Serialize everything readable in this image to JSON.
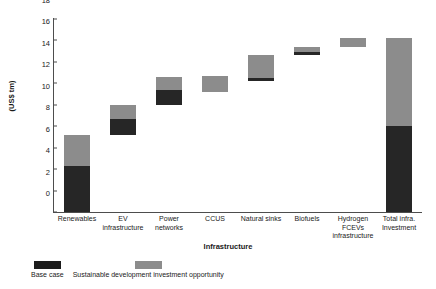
{
  "chart_data": {
    "type": "bar",
    "subtype": "waterfall-stacked",
    "title": "",
    "xlabel": "Infrastructure",
    "ylabel": "(US$ tm)",
    "ylim": [
      0,
      18
    ],
    "ytick_values": [
      0,
      2,
      4,
      6,
      8,
      10,
      12,
      14,
      16,
      18
    ],
    "ytick_labels": [
      "0",
      "2",
      "4",
      "6",
      "8",
      "10",
      "12",
      "14",
      "16",
      "18"
    ],
    "grid": false,
    "legend_position": "below-left",
    "categories": [
      "Renewables",
      "EV infrastructure",
      "Power networks",
      "CCUS",
      "Natural sinks",
      "Biofuels",
      "Hydrogen FCEVs infrastructure",
      "Total infra. Investment"
    ],
    "series": [
      {
        "name": "Base case",
        "color": "#262626",
        "values": [
          4.3,
          1.5,
          1.4,
          0.0,
          0.3,
          0.3,
          0.0,
          8.0
        ]
      },
      {
        "name": "Sustainable development investment opportunity",
        "color": "#8c8c8c",
        "values": [
          2.9,
          1.3,
          1.2,
          1.5,
          2.1,
          0.5,
          0.8,
          8.2
        ]
      }
    ],
    "bars": [
      {
        "category": "Renewables",
        "start": 0.0,
        "base_case": 4.3,
        "opportunity": 2.9,
        "total": 7.2,
        "is_total": false
      },
      {
        "category": "EV infrastructure",
        "start": 7.2,
        "base_case": 1.5,
        "opportunity": 1.3,
        "total": 10.0,
        "is_total": false
      },
      {
        "category": "Power networks",
        "start": 10.0,
        "base_case": 1.4,
        "opportunity": 1.2,
        "total": 12.6,
        "is_total": false
      },
      {
        "category": "CCUS",
        "start": 11.2,
        "base_case": 0.0,
        "opportunity": 1.5,
        "total": 12.7,
        "is_total": false
      },
      {
        "category": "Natural sinks",
        "start": 12.2,
        "base_case": 0.3,
        "opportunity": 2.1,
        "total": 14.6,
        "is_total": false
      },
      {
        "category": "Biofuels",
        "start": 14.6,
        "base_case": 0.3,
        "opportunity": 0.5,
        "total": 15.4,
        "is_total": false
      },
      {
        "category": "Hydrogen FCEVs infrastructure",
        "start": 15.4,
        "base_case": 0.0,
        "opportunity": 0.8,
        "total": 16.2,
        "is_total": false
      },
      {
        "category": "Total infra. Investment",
        "start": 0.0,
        "base_case": 8.0,
        "opportunity": 8.2,
        "total": 16.2,
        "is_total": true
      }
    ]
  },
  "legend": {
    "items": [
      {
        "label": "Base case",
        "color": "#1c1c1c"
      },
      {
        "label": "Sustainable development investment opportunity",
        "color": "#8c8c8c"
      }
    ]
  },
  "axis": {
    "y_title": "(US$ tm)",
    "x_title": "Infrastructure"
  }
}
